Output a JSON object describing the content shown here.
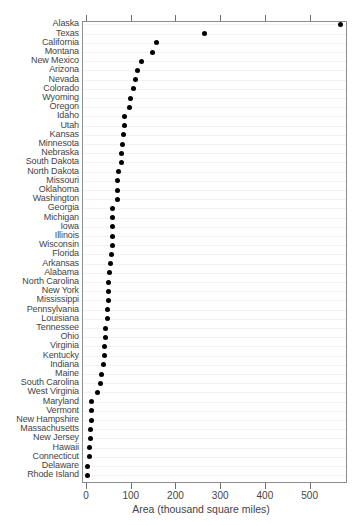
{
  "chart_data": {
    "type": "scatter",
    "subtype": "cleveland-dot-plot",
    "title": "",
    "xlabel": "Area (thousand square miles)",
    "ylabel": "",
    "xlim": [
      0,
      588
    ],
    "xticks": [
      0,
      100,
      200,
      300,
      400,
      500
    ],
    "xticklabels": [
      "0",
      "100",
      "200",
      "300",
      "400",
      "500"
    ],
    "grid": "horizontal-only",
    "legend": "none",
    "marker": "filled-circle",
    "marker_color": "#000000",
    "orientation": "horizontal",
    "sort": "descending",
    "categories": [
      "Alaska",
      "Texas",
      "California",
      "Montana",
      "New Mexico",
      "Arizona",
      "Nevada",
      "Colorado",
      "Wyoming",
      "Oregon",
      "Idaho",
      "Utah",
      "Kansas",
      "Minnesota",
      "Nebraska",
      "South Dakota",
      "North Dakota",
      "Missouri",
      "Oklahoma",
      "Washington",
      "Georgia",
      "Michigan",
      "Iowa",
      "Illinois",
      "Wisconsin",
      "Florida",
      "Arkansas",
      "Alabama",
      "North Carolina",
      "New York",
      "Mississippi",
      "Pennsylvania",
      "Louisiana",
      "Tennessee",
      "Ohio",
      "Virginia",
      "Kentucky",
      "Indiana",
      "Maine",
      "South Carolina",
      "West Virginia",
      "Maryland",
      "Vermont",
      "New Hampshire",
      "Massachusetts",
      "New Jersey",
      "Hawaii",
      "Connecticut",
      "Delaware",
      "Rhode Island"
    ],
    "values": [
      566,
      262,
      156,
      146,
      121,
      113,
      109,
      104,
      97,
      96,
      83,
      84,
      82,
      80,
      77,
      77,
      70,
      69,
      69,
      68,
      58,
      58,
      56,
      56,
      56,
      54,
      53,
      51,
      49,
      49,
      47,
      45,
      45,
      42,
      41,
      40,
      40,
      36,
      33,
      31,
      24,
      10,
      9,
      9,
      8,
      8,
      6,
      5,
      2,
      1
    ]
  }
}
